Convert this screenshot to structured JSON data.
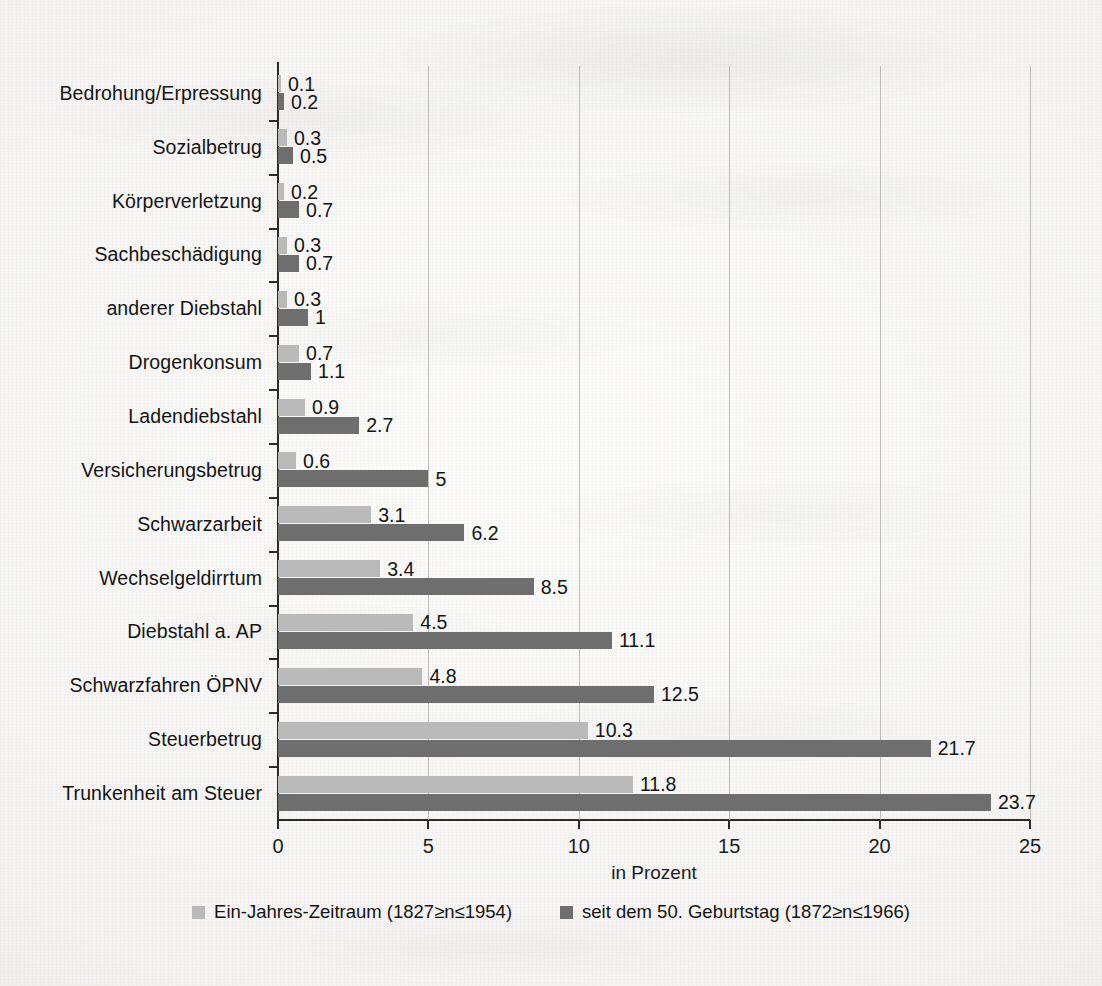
{
  "chart_data": {
    "type": "bar",
    "orientation": "horizontal",
    "grouped": true,
    "title": "",
    "xlabel": "in Prozent",
    "ylabel": "",
    "xlim": [
      0,
      25
    ],
    "xticks": [
      "0",
      "5",
      "10",
      "15",
      "20",
      "25"
    ],
    "grid": "vertical",
    "legend_position": "bottom",
    "categories": [
      "Bedrohung/Erpressung",
      "Sozialbetrug",
      "Körperverletzung",
      "Sachbeschädigung",
      "anderer Diebstahl",
      "Drogenkonsum",
      "Ladendiebstahl",
      "Versicherungsbetrug",
      "Schwarzarbeit",
      "Wechselgeldirrtum",
      "Diebstahl a. AP",
      "Schwarzfahren ÖPNV",
      "Steuerbetrug",
      "Trunkenheit am Steuer"
    ],
    "series": [
      {
        "name": "Ein-Jahres-Zeitraum (1827≥n≤1954)",
        "color": "#b9b9b9",
        "values": [
          0.1,
          0.3,
          0.2,
          0.3,
          0.3,
          0.7,
          0.9,
          0.6,
          3.1,
          3.4,
          4.5,
          4.8,
          10.3,
          11.8
        ],
        "labels": [
          "0.1",
          "0.3",
          "0.2",
          "0.3",
          "0.3",
          "0.7",
          "0.9",
          "0.6",
          "3.1",
          "3.4",
          "4.5",
          "4.8",
          "10.3",
          "11.8"
        ]
      },
      {
        "name": "seit dem 50. Geburtstag (1872≥n≤1966)",
        "color": "#6e6e6e",
        "values": [
          0.2,
          0.5,
          0.7,
          0.7,
          1,
          1.1,
          2.7,
          5,
          6.2,
          8.5,
          11.1,
          12.5,
          21.7,
          23.7
        ],
        "labels": [
          "0.2",
          "0.5",
          "0.7",
          "0.7",
          "1",
          "1.1",
          "2.7",
          "5",
          "6.2",
          "8.5",
          "11.1",
          "12.5",
          "21.7",
          "23.7"
        ]
      }
    ]
  },
  "legend": {
    "items": [
      {
        "label": "Ein-Jahres-Zeitraum (1827≥n≤1954)",
        "color": "#b9b9b9"
      },
      {
        "label": "seit dem 50. Geburtstag (1872≥n≤1966)",
        "color": "#6e6e6e"
      }
    ]
  }
}
